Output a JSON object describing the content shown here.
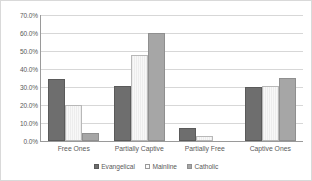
{
  "chart_data": {
    "type": "bar",
    "title": "",
    "subtitle": "",
    "xlabel": "",
    "ylabel": "",
    "categories": [
      "Free Ones",
      "Partially Captive",
      "Partially Free",
      "Captive Ones"
    ],
    "series": [
      {
        "name": "Evangelical",
        "color": "#6e6e6e",
        "values": [
          34.5,
          30.5,
          7.0,
          30.0
        ]
      },
      {
        "name": "Mainline",
        "color": "#f2f2f2",
        "values": [
          20.0,
          48.0,
          3.0,
          30.5
        ]
      },
      {
        "name": "Catholic",
        "color": "#a6a6a6",
        "values": [
          4.5,
          60.0,
          0.0,
          35.0
        ]
      }
    ],
    "ylim": [
      0,
      70
    ],
    "ytick_step": 10,
    "ytick_labels": [
      "70.0%",
      "60.0%",
      "50.0%",
      "40.0%",
      "30.0%",
      "20.0%",
      "10.0%",
      "0.0%"
    ],
    "ytick_values": [
      70,
      60,
      50,
      40,
      30,
      20,
      10,
      0
    ],
    "grid": true,
    "legend_position": "bottom",
    "value_format": "percent"
  },
  "colors": {
    "background": "#ffffff",
    "border": "#d9d9d9",
    "gridline": "#d7d7d7",
    "axis": "#9a9a9a",
    "text": "#595959"
  }
}
